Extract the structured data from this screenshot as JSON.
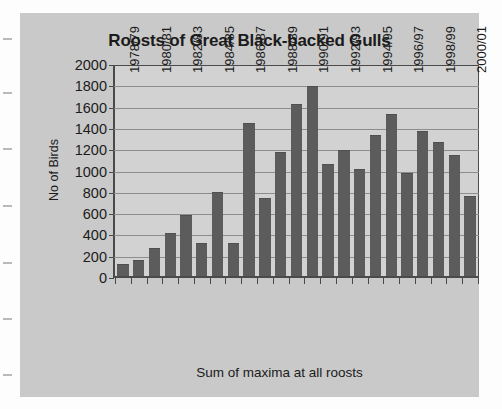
{
  "chart_data": {
    "type": "bar",
    "title": "Roosts of Great Black-backed Gulls",
    "xlabel": "Sum of maxima at all roosts",
    "ylabel": "No of Birds",
    "ylim": [
      0,
      2000
    ],
    "ytick_step": 200,
    "yticks": [
      "2000",
      "1800",
      "1600",
      "1400",
      "1200",
      "1000",
      "800",
      "600",
      "400",
      "200",
      "0"
    ],
    "grid": true,
    "legend": "none",
    "bar_color": "#5c5c5c",
    "plot_background": "#d2d2d2",
    "panel_background": "#c9c9c9",
    "categories": [
      "1978/79",
      "1979/80",
      "1980/81",
      "1981/82",
      "1982/83",
      "1983/84",
      "1984/85",
      "1985/86",
      "1986/87",
      "1987/88",
      "1988/89",
      "1989/90",
      "1990/91",
      "1991/92",
      "1992/93",
      "1993/94",
      "1994/95",
      "1995/96",
      "1996/97",
      "1997/98",
      "1998/99",
      "1999/00",
      "2000/01"
    ],
    "visible_tick_labels": [
      "1978/79",
      "1980/81",
      "1982/83",
      "1984/85",
      "1986/87",
      "1988/89",
      "1990/91",
      "1992/93",
      "1994/95",
      "1996/97",
      "1998/99",
      "2000/01"
    ],
    "values": [
      110,
      150,
      265,
      410,
      580,
      315,
      795,
      310,
      1450,
      735,
      1180,
      1635,
      1805,
      1060,
      1190,
      1010,
      1340,
      1540,
      975,
      1370,
      1270,
      1145,
      760
    ]
  }
}
